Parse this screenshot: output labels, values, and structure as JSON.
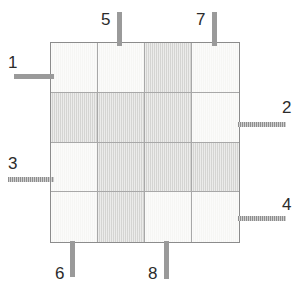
{
  "diagram": {
    "colors": {
      "cell_light": "#f6f6f4",
      "cell_dark": "#d4d4d2",
      "grid_border": "#8c8c8c",
      "grid_line": "#a8a8a8",
      "stub": "#9a9a9a",
      "label_text": "#2b2b2b",
      "background": "#ffffff"
    },
    "grid": {
      "rows": 4,
      "columns": 4,
      "cells": [
        [
          "light",
          "light",
          "dark",
          "light"
        ],
        [
          "dark",
          "dark",
          "dark",
          "light"
        ],
        [
          "light",
          "dark",
          "dark",
          "dark"
        ],
        [
          "light",
          "dark",
          "light",
          "light"
        ]
      ]
    },
    "terminals": [
      {
        "label": "1",
        "side": "left",
        "style": "solid",
        "stub": {
          "left": 14,
          "top": 74,
          "width": 40,
          "height": 5
        },
        "text": {
          "left": 8,
          "top": 54
        }
      },
      {
        "label": "2",
        "side": "right",
        "style": "hatched",
        "stub": {
          "left": 238,
          "top": 122,
          "width": 48,
          "height": 5
        },
        "text": {
          "left": 282,
          "top": 99
        }
      },
      {
        "label": "3",
        "side": "left",
        "style": "hatched",
        "stub": {
          "left": 8,
          "top": 177,
          "width": 46,
          "height": 5
        },
        "text": {
          "left": 8,
          "top": 155
        }
      },
      {
        "label": "4",
        "side": "right",
        "style": "hatched",
        "stub": {
          "left": 238,
          "top": 216,
          "width": 48,
          "height": 5
        },
        "text": {
          "left": 282,
          "top": 196
        }
      },
      {
        "label": "5",
        "side": "top",
        "style": "solid",
        "stub": {
          "left": 117,
          "top": 12,
          "width": 5,
          "height": 34
        },
        "text": {
          "left": 101,
          "top": 11
        }
      },
      {
        "label": "6",
        "side": "bottom",
        "style": "solid",
        "stub": {
          "left": 70,
          "top": 241,
          "width": 5,
          "height": 36
        },
        "text": {
          "left": 55,
          "top": 265
        }
      },
      {
        "label": "7",
        "side": "top",
        "style": "solid",
        "stub": {
          "left": 212,
          "top": 12,
          "width": 5,
          "height": 34
        },
        "text": {
          "left": 196,
          "top": 11
        }
      },
      {
        "label": "8",
        "side": "bottom",
        "style": "solid",
        "stub": {
          "left": 164,
          "top": 241,
          "width": 5,
          "height": 38
        },
        "text": {
          "left": 148,
          "top": 265
        }
      }
    ]
  }
}
